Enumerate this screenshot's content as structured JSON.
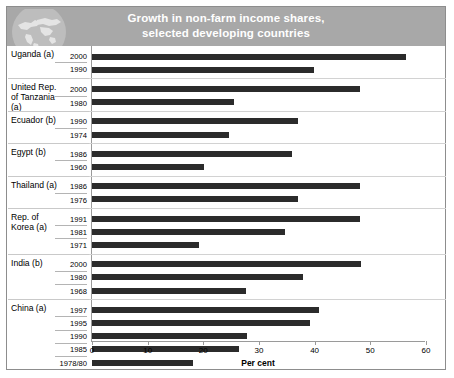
{
  "header": {
    "title_line1": "Growth in non-farm income shares,",
    "title_line2": "selected developing countries",
    "icon": "globe-world-map-icon",
    "bg_color": "#a8a8a8",
    "title_color": "#ffffff"
  },
  "axis": {
    "x_title": "Per cent",
    "ticks": [
      "0",
      "10",
      "20",
      "30",
      "40",
      "50",
      "60"
    ]
  },
  "groups": [
    {
      "name": "Uganda",
      "note": "(a)",
      "rows": [
        {
          "year": "2000",
          "value": 56.5
        },
        {
          "year": "1990",
          "value": 39.9
        }
      ]
    },
    {
      "name": "United Rep. of Tanzania",
      "note": "(a)",
      "rows": [
        {
          "year": "2000",
          "value": 48.1
        },
        {
          "year": "1980",
          "value": 25.5
        }
      ]
    },
    {
      "name": "Ecuador",
      "note": "(b)",
      "rows": [
        {
          "year": "1990",
          "value": 37.0
        },
        {
          "year": "1974",
          "value": 24.6
        }
      ]
    },
    {
      "name": "Egypt",
      "note": "(b)",
      "rows": [
        {
          "year": "1986",
          "value": 35.9
        },
        {
          "year": "1960",
          "value": 20.1
        }
      ]
    },
    {
      "name": "Thailand",
      "note": "(a)",
      "rows": [
        {
          "year": "1986",
          "value": 48.1
        },
        {
          "year": "1976",
          "value": 37.0
        }
      ]
    },
    {
      "name": "Rep. of Korea",
      "note": "(a)",
      "rows": [
        {
          "year": "1991",
          "value": 48.1
        },
        {
          "year": "1981",
          "value": 34.7
        },
        {
          "year": "1971",
          "value": 19.2
        }
      ]
    },
    {
      "name": "India",
      "note": "(b)",
      "rows": [
        {
          "year": "2000",
          "value": 48.3
        },
        {
          "year": "1980",
          "value": 37.9
        },
        {
          "year": "1968",
          "value": 27.6
        }
      ]
    },
    {
      "name": "China",
      "note": "(a)",
      "rows": [
        {
          "year": "1997",
          "value": 40.8
        },
        {
          "year": "1995",
          "value": 39.1
        },
        {
          "year": "1990",
          "value": 27.8
        },
        {
          "year": "1985",
          "value": 26.4
        },
        {
          "year": "1978/80",
          "value": 18.1
        }
      ]
    }
  ],
  "chart_data": {
    "type": "bar",
    "orientation": "horizontal",
    "title": "Growth in non-farm income shares, selected developing countries",
    "xlabel": "Per cent",
    "ylabel": "",
    "xlim": [
      0,
      60
    ],
    "xticks": [
      0,
      10,
      20,
      30,
      40,
      50,
      60
    ],
    "grid": false,
    "legend": "none",
    "bar_color": "#2b2b2b",
    "categories": [
      "Uganda (a) 2000",
      "Uganda (a) 1990",
      "United Rep. of Tanzania (a) 2000",
      "United Rep. of Tanzania (a) 1980",
      "Ecuador (b) 1990",
      "Ecuador (b) 1974",
      "Egypt (b) 1986",
      "Egypt (b) 1960",
      "Thailand (a) 1986",
      "Thailand (a) 1976",
      "Rep. of Korea (a) 1991",
      "Rep. of Korea (a) 1981",
      "Rep. of Korea (a) 1971",
      "India (b) 2000",
      "India (b) 1980",
      "India (b) 1968",
      "China (a) 1997",
      "China (a) 1995",
      "China (a) 1990",
      "China (a) 1985",
      "China (a) 1978/80"
    ],
    "values": [
      56.5,
      39.9,
      48.1,
      25.5,
      37.0,
      24.6,
      35.9,
      20.1,
      48.1,
      37.0,
      48.1,
      34.7,
      19.2,
      48.3,
      37.9,
      27.6,
      40.8,
      39.1,
      27.8,
      26.4,
      18.1
    ]
  }
}
